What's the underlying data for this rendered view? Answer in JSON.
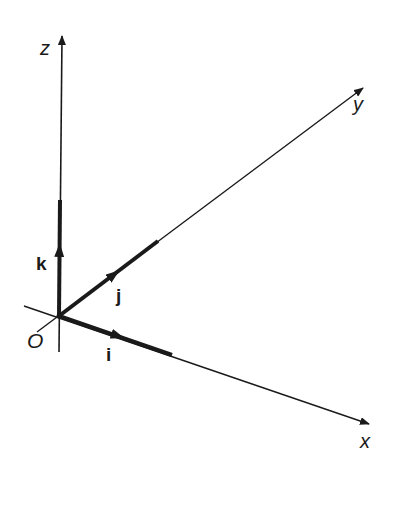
{
  "diagram": {
    "title": "",
    "axes": [
      {
        "name": "x",
        "label": "x"
      },
      {
        "name": "y",
        "label": "y"
      },
      {
        "name": "z",
        "label": "z"
      }
    ],
    "origin_label": "O",
    "unit_vectors": [
      {
        "name": "i",
        "label": "i",
        "axis": "x"
      },
      {
        "name": "j",
        "label": "j",
        "axis": "y"
      },
      {
        "name": "k",
        "label": "k",
        "axis": "z"
      }
    ],
    "colors": {
      "line": "#1a1a1a",
      "background": "#ffffff"
    }
  }
}
